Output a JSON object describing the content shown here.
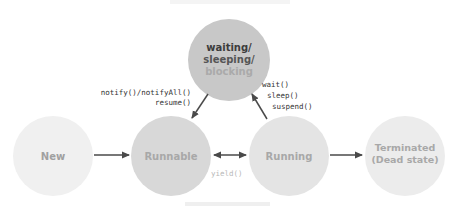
{
  "diagram": {
    "type": "state-diagram",
    "states": [
      {
        "id": "waiting",
        "lines": [
          "waiting/",
          "sleeping/",
          "blocking"
        ],
        "fill": "#c8c8c8",
        "line_colors": [
          "#3c3c3c",
          "#555555",
          "#aaaaaa"
        ]
      },
      {
        "id": "new",
        "lines": [
          "New"
        ],
        "fill": "#f0f0f0",
        "line_colors": [
          "#a0a0a0"
        ]
      },
      {
        "id": "runnable",
        "lines": [
          "Runnable"
        ],
        "fill": "#d8d8d8",
        "line_colors": [
          "#a8a8a8"
        ]
      },
      {
        "id": "running",
        "lines": [
          "Running"
        ],
        "fill": "#e4e4e4",
        "line_colors": [
          "#a8a8a8"
        ]
      },
      {
        "id": "terminated",
        "lines": [
          "Terminated",
          "(Dead state)"
        ],
        "fill": "#ececec",
        "line_colors": [
          "#a8a8a8",
          "#a8a8a8"
        ]
      }
    ],
    "transitions": [
      {
        "from": "new",
        "to": "runnable",
        "label": ""
      },
      {
        "from": "runnable",
        "to": "running",
        "label": "yield()",
        "bidirectional": true
      },
      {
        "from": "running",
        "to": "terminated",
        "label": ""
      },
      {
        "from": "running",
        "to": "waiting",
        "label_lines": [
          "wait()",
          "sleep()",
          "suspend()"
        ]
      },
      {
        "from": "waiting",
        "to": "runnable",
        "label_lines": [
          "notify()/notifyAll()",
          "resume()"
        ]
      }
    ],
    "colors": {
      "arrow": "#4a4a4a",
      "code_text": "#333333",
      "yield_text": "#b8b8b8"
    }
  },
  "labels": {
    "waiting_l1": "waiting/",
    "waiting_l2": "sleeping/",
    "waiting_l3": "blocking",
    "new": "New",
    "runnable": "Runnable",
    "running": "Running",
    "terminated_l1": "Terminated",
    "terminated_l2": "(Dead state)",
    "notify": "notify()/notifyAll()",
    "resume": "resume()",
    "wait": "wait()",
    "sleep": "sleep()",
    "suspend": "suspend()",
    "yield": "yield()"
  }
}
